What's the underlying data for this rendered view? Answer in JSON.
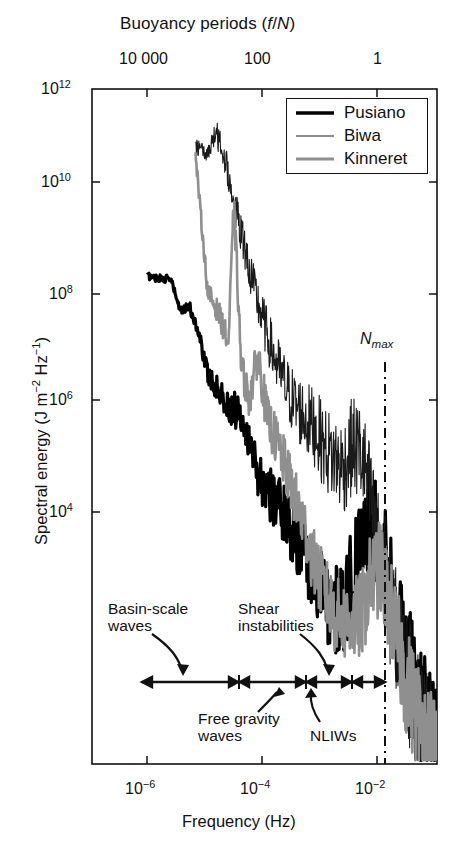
{
  "figure": {
    "background": "#ffffff",
    "foreground": "#111111"
  },
  "top_axis": {
    "title_main": "Buoyancy periods (",
    "title_italic_f": "f",
    "title_slash": "/",
    "title_italic_N": "N",
    "title_close": ")",
    "title_full": "Buoyancy periods (f/N)",
    "ticks": [
      "10 000",
      "100",
      "1"
    ]
  },
  "x_axis": {
    "title": "Frequency (Hz)",
    "ticks": [
      {
        "mantissa": "10",
        "exp": "−6",
        "label": "10⁻⁶"
      },
      {
        "mantissa": "10",
        "exp": "−4",
        "label": "10⁻⁴"
      },
      {
        "mantissa": "10",
        "exp": "−2",
        "label": "10⁻²"
      }
    ]
  },
  "y_axis": {
    "title_prefix": "Spectral energy (J m",
    "title_exp1": "−2",
    "title_mid": " Hz",
    "title_exp2": "−1",
    "title_suffix": ")",
    "title_full": "Spectral energy (J m⁻² Hz⁻¹)",
    "ticks": [
      {
        "mantissa": "10",
        "exp": "12"
      },
      {
        "mantissa": "10",
        "exp": "10"
      },
      {
        "mantissa": "10",
        "exp": "8"
      },
      {
        "mantissa": "10",
        "exp": "6"
      },
      {
        "mantissa": "10",
        "exp": "4"
      }
    ]
  },
  "legend": {
    "entries": [
      {
        "label": "Pusiano",
        "color": "#000000",
        "width": 3.2
      },
      {
        "label": "Biwa",
        "color": "#1a1a1a",
        "width": 1.1
      },
      {
        "label": "Kinneret",
        "color": "#8f8f8f",
        "width": 2.6
      }
    ]
  },
  "markers": {
    "nmax_label_N": "N",
    "nmax_label_sub": "max",
    "nmax_label": "N_max",
    "nmax_linestyle": "dash-dot"
  },
  "annotations": [
    {
      "id": "basin-scale-waves",
      "line1": "Basin-scale",
      "line2": "waves",
      "text": "Basin-scale waves"
    },
    {
      "id": "shear-instabilities",
      "line1": "Shear",
      "line2": "instabilities",
      "text": "Shear instabilities"
    },
    {
      "id": "free-gravity-waves",
      "line1": "Free gravity",
      "line2": "waves",
      "text": "Free gravity waves"
    },
    {
      "id": "nliws",
      "line1": "NLIWs",
      "line2": "",
      "text": "NLIWs"
    }
  ],
  "chart_data": {
    "type": "line",
    "title": "",
    "xlabel": "Frequency (Hz)",
    "ylabel": "Spectral energy (J m^-2 Hz^-1)",
    "top_xlabel": "Buoyancy periods (f/N)",
    "xscale": "log",
    "yscale": "log",
    "xlim": [
      3.16e-07,
      0.0316
    ],
    "ylim": [
      1000.0,
      1000000000000.0
    ],
    "xticks": [
      1e-06,
      0.0001,
      0.01
    ],
    "xticklabels": [
      "10^-6",
      "10^-4",
      "10^-2"
    ],
    "yticks": [
      1000000000000.0,
      10000000000.0,
      100000000.0,
      1000000.0,
      10000.0
    ],
    "yticklabels": [
      "10^12",
      "10^10",
      "10^8",
      "10^6",
      "10^4"
    ],
    "top_xticks": [
      1e-05,
      0.001,
      0.1
    ],
    "top_xticklabels": [
      "10 000",
      "100",
      "1"
    ],
    "grid": false,
    "legend_position": "top-right",
    "vertical_markers": [
      {
        "label": "N_max",
        "x": 0.011,
        "style": "dashdot",
        "color": "#111111"
      }
    ],
    "series": [
      {
        "name": "Pusiano",
        "color": "#000000",
        "linewidth": 3.2,
        "x": [
          2e-06,
          3e-06,
          4.4e-06,
          6e-06,
          8e-06,
          1.1e-05,
          1.5e-05,
          2e-05,
          2.8e-05,
          3.8e-05,
          5e-05,
          7e-05,
          9e-05,
          0.00012,
          0.00016,
          0.00022,
          0.0003,
          0.0004,
          0.00055,
          0.00075,
          0.001,
          0.0014,
          0.0019,
          0.0025,
          0.0034,
          0.0045,
          0.006,
          0.008,
          0.0105,
          0.014,
          0.019,
          0.025,
          0.031
        ],
        "y": [
          3200000000.0,
          3000000000.0,
          2900000000.0,
          1100000000.0,
          1300000000.0,
          600000000.0,
          160000000.0,
          110000000.0,
          60000000.0,
          52000000.0,
          45000000.0,
          12000000.0,
          6000000.0,
          4000000.0,
          3000000.0,
          1800000.0,
          900000.0,
          500000.0,
          300000.0,
          140000.0,
          110000.0,
          130000.0,
          300000.0,
          800000.0,
          2200000.0,
          1200000.0,
          300000.0,
          90000.0,
          30000.0,
          12000.0,
          5000.0,
          2400.0,
          1400.0
        ]
      },
      {
        "name": "Biwa",
        "color": "#1a1a1a",
        "linewidth": 1.1,
        "x": [
          1e-05,
          1.4e-05,
          2e-05,
          2.8e-05,
          3.6e-05,
          5e-05,
          7e-05,
          0.0001,
          0.00014,
          0.0002,
          0.00028,
          0.0004,
          0.00055,
          0.00075,
          0.001,
          0.0014,
          0.0019,
          0.0026,
          0.0035,
          0.0047,
          0.0063,
          0.0085,
          0.011,
          0.015,
          0.02,
          0.026,
          0.031
        ],
        "y": [
          180000000000.0,
          130000000000.0,
          260000000000.0,
          100000000000.0,
          30000000000.0,
          9000000000.0,
          2200000000.0,
          700000000.0,
          260000000.0,
          110000000.0,
          60000000.0,
          40000000.0,
          30000000.0,
          16000000.0,
          12000000.0,
          9000000.0,
          18000000.0,
          13000000.0,
          3000000.0,
          600000.0,
          160000.0,
          50000.0,
          18000.0,
          7000.0,
          3200.0,
          1800.0,
          1300.0
        ]
      },
      {
        "name": "Kinneret",
        "color": "#8f8f8f",
        "linewidth": 2.6,
        "x": [
          1e-05,
          1.5e-05,
          2.2e-05,
          3e-05,
          3.6e-05,
          4.6e-05,
          6e-05,
          8e-05,
          0.00011,
          0.00015,
          0.00021,
          0.00029,
          0.0004,
          0.00055,
          0.00075,
          0.001,
          0.0014,
          0.0019,
          0.0026,
          0.0035,
          0.0047,
          0.0063,
          0.0085,
          0.011,
          0.015,
          0.02,
          0.026,
          0.031
        ],
        "y": [
          130000000000.0,
          2000000000.0,
          1000000000.0,
          400000000.0,
          30000000000.0,
          200000000.0,
          70000000.0,
          300000000.0,
          40000000.0,
          20000000.0,
          8000000.0,
          3000000.0,
          1200000.0,
          400000.0,
          200000.0,
          100000.0,
          80000.0,
          80000.0,
          100000.0,
          300000.0,
          400000.0,
          150000.0,
          40000.0,
          14000.0,
          6000.0,
          2800.0,
          1700.0,
          1300.0
        ]
      }
    ],
    "band_annotations": [
      {
        "label": "Basin-scale waves",
        "x_range": [
          4e-07,
          1e-05
        ]
      },
      {
        "label": "Free gravity waves",
        "x_range": [
          1e-05,
          0.0002
        ]
      },
      {
        "label": "NLIWs",
        "x_range": [
          0.0002,
          0.0015
        ]
      },
      {
        "label": "Shear instabilities",
        "x_range": [
          0.0015,
          0.012
        ]
      }
    ]
  }
}
